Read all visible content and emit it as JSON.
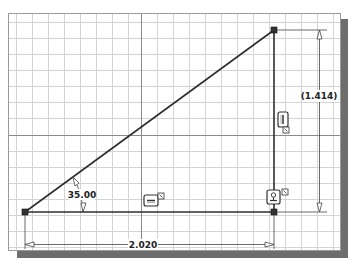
{
  "sketch": {
    "grid": {
      "minor_spacing_px": 16,
      "color": "#d4d4d4",
      "axis_color": "#7a7a7a"
    },
    "geometry": {
      "line_color": "#2e2e2e",
      "point_color": "#333333"
    },
    "dimensions": {
      "angle": {
        "label": "35.00",
        "type": "angular"
      },
      "horizontal": {
        "label": "2.020",
        "type": "linear"
      },
      "vertical": {
        "label": "(1.414)",
        "type": "reference"
      }
    },
    "constraints": [
      {
        "name": "horizontal-constraint",
        "icon": "horizontal-constraint-icon"
      },
      {
        "name": "vertical-constraint",
        "icon": "vertical-constraint-icon"
      },
      {
        "name": "perpendicular-constraint",
        "icon": "perpendicular-constraint-icon"
      }
    ]
  }
}
